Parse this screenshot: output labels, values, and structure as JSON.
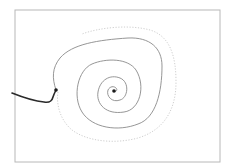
{
  "diagram": {
    "type": "phase-portrait-spiral",
    "width": 228,
    "height": 168,
    "colors": {
      "background": "#ffffff",
      "frame": "#b8b8b8",
      "spiral": "#8a8a8a",
      "limit_cycle": "#cfcfcf",
      "incoming_path": "#2a2a2a",
      "points": "#1a1a1a"
    },
    "frame": {
      "x": 15,
      "y": 10,
      "w": 205,
      "h": 152
    },
    "elements": {
      "incoming_path": {
        "d": "M12,93 C22,97 34,101 44,102 C50,103 52,101 53,97 C54,94 55,92 56,90"
      },
      "start_point": {
        "cx": 56,
        "cy": 90,
        "r": 1.8
      },
      "center_point": {
        "cx": 114,
        "cy": 91,
        "r": 1.8
      },
      "spiral": {
        "d": "M56,90 C52,78 52,68 60,58 C72,44 98,40 128,38 C150,37 162,48 162,66 C162,92 156,118 138,124 C118,132 92,128 82,112 C72,96 78,70 92,64 C106,58 128,58 136,70 C146,86 140,110 124,112 C106,115 96,104 98,92 C100,80 110,74 120,78 C130,82 128,98 120,100 C112,103 106,96 108,90 C110,86 114,86 116,88 C118,90 116,92 114,91"
      },
      "limit_cycle": {
        "d": "M58,92 C56,104 60,120 72,130 C88,142 116,144 138,138 C164,130 176,110 176,82 C176,56 170,36 150,30 C128,24 98,28 82,34"
      }
    }
  }
}
